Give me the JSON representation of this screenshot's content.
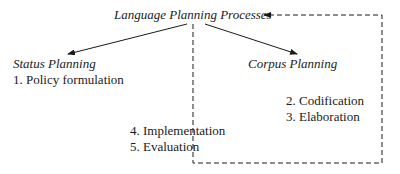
{
  "diagram": {
    "root": {
      "label": "Language Planning Processes"
    },
    "branches": [
      {
        "label": "Status Planning",
        "items": [
          "1. Policy formulation"
        ]
      },
      {
        "label": "Corpus Planning",
        "items": [
          "2. Codification",
          "3. Elaboration"
        ]
      }
    ],
    "shared_items": [
      "4. Implementation",
      "5. Evaluation"
    ],
    "edges": [
      {
        "from": "Language Planning Processes",
        "to": "Status Planning",
        "style": "solid-arrow"
      },
      {
        "from": "Language Planning Processes",
        "to": "Corpus Planning",
        "style": "solid-arrow"
      },
      {
        "from": "Evaluation",
        "to": "Language Planning Processes",
        "style": "dashed-feedback-arrow"
      }
    ],
    "colors": {
      "ink": "#1a1a1a",
      "background": "#ffffff"
    }
  }
}
